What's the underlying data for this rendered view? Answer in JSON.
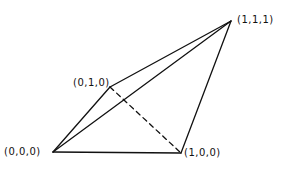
{
  "diagram": {
    "type": "tetrahedron",
    "vertices": [
      {
        "id": "v000",
        "label": "(0,0,0)",
        "x": 53,
        "y": 152,
        "label_x": 4,
        "label_y": 146
      },
      {
        "id": "v100",
        "label": "(1,0,0)",
        "x": 181,
        "y": 153,
        "label_x": 184,
        "label_y": 147
      },
      {
        "id": "v010",
        "label": "(0,1,0)",
        "x": 110,
        "y": 87,
        "label_x": 73,
        "label_y": 77
      },
      {
        "id": "v111",
        "label": "(1,1,1)",
        "x": 231,
        "y": 21,
        "label_x": 237,
        "label_y": 14
      }
    ],
    "edges": [
      {
        "from": "v000",
        "to": "v100",
        "style": "solid"
      },
      {
        "from": "v000",
        "to": "v010",
        "style": "solid"
      },
      {
        "from": "v000",
        "to": "v111",
        "style": "solid"
      },
      {
        "from": "v010",
        "to": "v111",
        "style": "solid"
      },
      {
        "from": "v100",
        "to": "v111",
        "style": "solid"
      },
      {
        "from": "v010",
        "to": "v100",
        "style": "dashed"
      }
    ],
    "stroke_color": "#111111"
  }
}
